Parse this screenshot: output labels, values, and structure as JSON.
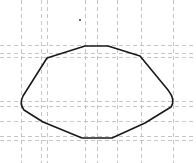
{
  "diagram": {
    "type": "closed-curve-on-dashed-grid",
    "width": 196,
    "height": 163,
    "grid": {
      "color": "#b8b8b8",
      "dash": "4 3",
      "vertical_x": [
        21,
        41,
        47,
        85,
        97,
        117,
        141,
        173
      ],
      "horizontal_y": [
        45,
        53,
        57,
        101,
        106,
        121,
        136,
        140
      ]
    },
    "curve": {
      "color": "#1a1a1a",
      "stroke_width": 1.6,
      "path": "M 85 46 L 108 46 L 140 56 L 168 90 Q 176 100 171 107 L 145 123 L 112 138 L 82 138 L 43 122 L 24 110 Q 19 104 23 96 L 47 58 L 85 46 Z"
    },
    "marker": {
      "x": 79,
      "y": 19,
      "color": "#666666"
    }
  }
}
